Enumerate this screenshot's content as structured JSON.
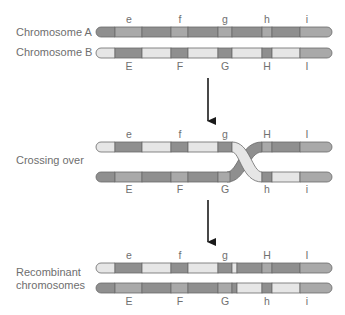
{
  "labels": {
    "chromosome_a": "Chromosome A",
    "chromosome_b": "Chromosome B",
    "crossing_over": "Crossing over",
    "recombinant_line1": "Recombinant",
    "recombinant_line2": "chromosomes"
  },
  "genes": {
    "lowercase": [
      "e",
      "f",
      "g",
      "h",
      "i"
    ],
    "uppercase": [
      "E",
      "F",
      "G",
      "H",
      "I"
    ]
  },
  "panels": {
    "parental": {
      "top_labels": [
        "e",
        "f",
        "g",
        "h",
        "i"
      ],
      "bottom_labels": [
        "E",
        "F",
        "G",
        "H",
        "I"
      ]
    },
    "crossing_over": {
      "top_labels": [
        "e",
        "f",
        "g",
        "H",
        "I"
      ],
      "bottom_labels": [
        "E",
        "F",
        "G",
        "h",
        "i"
      ]
    },
    "recombinant": {
      "top_labels": [
        "e",
        "f",
        "g",
        "H",
        "I"
      ],
      "bottom_labels": [
        "E",
        "F",
        "G",
        "h",
        "i"
      ]
    }
  },
  "colors": {
    "dark": "#8f8f8f",
    "medium": "#a9a9a9",
    "light": "#e6e6e6",
    "outline": "#6a6a6a",
    "arrow": "#1a1a1a",
    "text": "#6e6e6e"
  }
}
